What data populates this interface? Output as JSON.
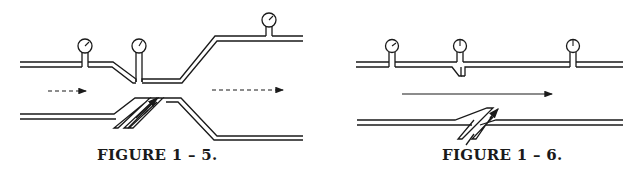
{
  "figures": [
    {
      "id": "fig-1-5",
      "caption": "FIGURE 1 – 5.",
      "flow_arrows": [
        "dashed",
        "dashed"
      ],
      "gauges": 3
    },
    {
      "id": "fig-1-6",
      "caption": "FIGURE 1 – 6.",
      "flow_arrows": [
        "solid"
      ],
      "gauges": 3
    }
  ],
  "colors": {
    "ink": "#1a1a1a",
    "background": "#ffffff"
  }
}
